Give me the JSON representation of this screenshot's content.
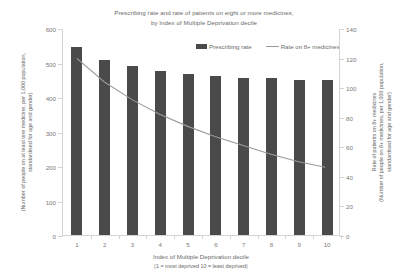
{
  "chart_data": {
    "type": "bar",
    "title": "Prescribing rate and rate of patients on eight or more medicines, by Index of Multiple Deprivation decile",
    "title_lines": [
      "Prescribing rate and rate of patients on eight or more medicines,",
      "by Index of Multiple Deprivation decile"
    ],
    "categories": [
      "1",
      "2",
      "3",
      "4",
      "5",
      "6",
      "7",
      "8",
      "9",
      "10"
    ],
    "series": [
      {
        "name": "Prescribing rate",
        "type": "bar",
        "axis": "left",
        "color": "#4a4a4a",
        "values": [
          545,
          508,
          490,
          475,
          468,
          462,
          456,
          455,
          450,
          448
        ]
      },
      {
        "name": "Rate on 8+ medicines",
        "type": "line",
        "axis": "right",
        "color": "#9a9a9a",
        "values": [
          120,
          104,
          92,
          82,
          74,
          67,
          61,
          55,
          50,
          46
        ]
      }
    ],
    "xlabel": "Index of Multiple Deprivation decile",
    "xlabel_sub": "(1 = most deprived 10 = least deprived)",
    "ylabel": "Prescribing rate",
    "ylabel_sub": "(Number of people on at least one medicine, per 1,000 population, standardised for age and gender)",
    "ylabel_right": "Rate of patients on 8+ medicines",
    "ylabel_right_sub": "(Number of people on 8+ medicines, per 1,000 population, standardised for age and gender)",
    "ylim": [
      0,
      600
    ],
    "yticks": [
      0,
      100,
      200,
      300,
      400,
      500,
      600
    ],
    "ylim_right": [
      0,
      140
    ],
    "yticks_right": [
      0,
      20,
      40,
      60,
      80,
      100,
      120,
      140
    ],
    "grid": false,
    "legend_position": "top-right",
    "legend": [
      "Prescribing rate",
      "Rate on 8+ medicines"
    ]
  },
  "axis_titles": {
    "left_main": "Prescribing rate",
    "left_sub_line1": "(Number of people on at least one medicine, per 1,000 population,",
    "left_sub_line2": "standardised for age and gender)",
    "right_main": "Rate of patients on 8+ medicines",
    "right_sub_line1": "(Number of people on 8+ medicines, per 1,000 population,",
    "right_sub_line2": "standardised for age and gender)"
  },
  "colors": {
    "bar": "#4a4a4a",
    "line": "#9a9a9a",
    "axis": "#d4d4d4",
    "text": "#6a6a6a",
    "background": "#ffffff"
  }
}
